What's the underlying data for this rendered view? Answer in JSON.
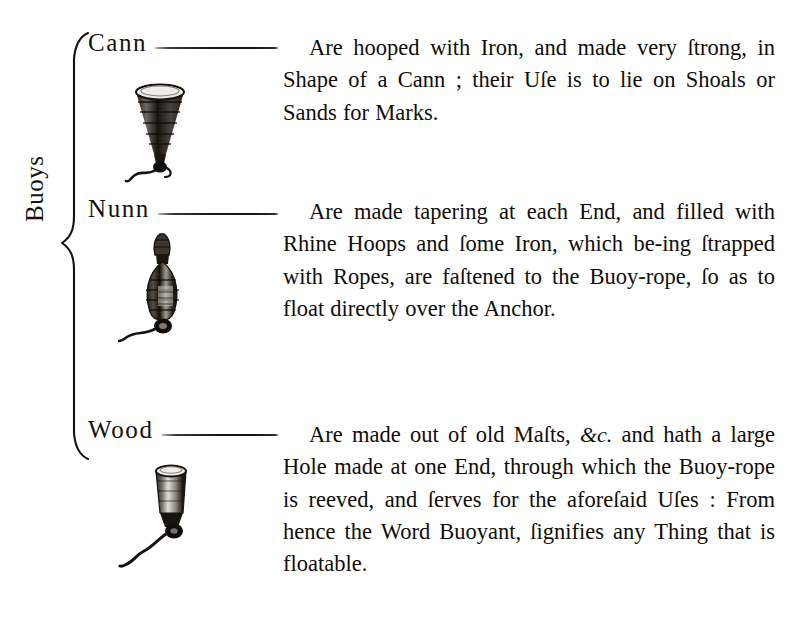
{
  "page": {
    "group_label": "Buoys",
    "background_color": "#ffffff",
    "ink_color": "#100d0a"
  },
  "entries": [
    {
      "term": "Cann",
      "figure_name": "cann-buoy-illustration",
      "figure_shape": "cone",
      "text": "Are hooped with Iron, and made very ſtrong, in Shape of a Cann ; their Uſe is to lie on Shoals or Sands for Marks."
    },
    {
      "term": "Nunn",
      "figure_name": "nunn-buoy-illustration",
      "figure_shape": "double-taper",
      "text": "Are made tapering at each End, and filled with Rhine Hoops and ſome Iron, which be-ing ſtrapped with Ropes, are faſtened to the Buoy-rope, ſo as to float directly over the Anchor."
    },
    {
      "term": "Wood",
      "figure_name": "wood-buoy-illustration",
      "figure_shape": "cylinder",
      "text_parts": {
        "before_amp": "Are made out of old Maſts, ",
        "amp": "&c.",
        "after_amp": " and hath a large Hole made at one End, through which the Buoy-rope is reeved, and ſerves for the aforeſaid Uſes : From hence the Word Buoyant, ſignifies any Thing that is floatable."
      }
    }
  ]
}
